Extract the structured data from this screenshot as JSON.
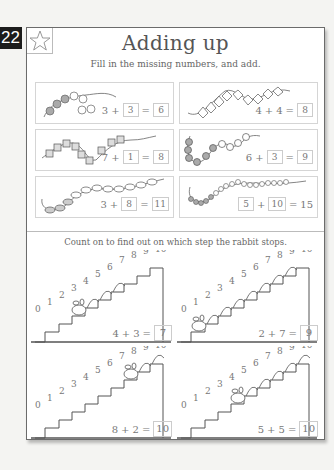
{
  "page_number": "22",
  "header": {
    "star_icon": "star-icon",
    "title": "Adding up",
    "subtitle": "Fill in the missing numbers, and add."
  },
  "bead_exercises": [
    {
      "a": "3",
      "b": "3",
      "sum": "6",
      "boxed": [
        "b",
        "sum"
      ],
      "bead_style": "round-grey-and-white"
    },
    {
      "a": "4",
      "b": "4",
      "sum": "8",
      "boxed": [
        "sum"
      ],
      "bead_style": "triangle-diamond"
    },
    {
      "a": "7",
      "b": "1",
      "sum": "8",
      "boxed": [
        "b",
        "sum"
      ],
      "bead_style": "cube"
    },
    {
      "a": "6",
      "b": "3",
      "sum": "9",
      "boxed": [
        "b",
        "sum"
      ],
      "bead_style": "round-grey-and-white"
    },
    {
      "a": "3",
      "b": "8",
      "sum": "11",
      "boxed": [
        "b",
        "sum"
      ],
      "bead_style": "oval"
    },
    {
      "a": "5",
      "b": "10",
      "sum": "15",
      "boxed": [
        "a",
        "b"
      ],
      "bead_style": "small-round"
    }
  ],
  "operators": {
    "plus": "+",
    "equals": "="
  },
  "stairs_section": {
    "instruction": "Count on to find out on which step the rabbit stops.",
    "step_labels": [
      "0",
      "1",
      "2",
      "3",
      "4",
      "5",
      "6",
      "7",
      "8",
      "9",
      "10"
    ],
    "exercises": [
      {
        "start": "4",
        "add": "3",
        "answer": "7"
      },
      {
        "start": "2",
        "add": "7",
        "answer": "9"
      },
      {
        "start": "8",
        "add": "2",
        "answer": "10"
      },
      {
        "start": "5",
        "add": "5",
        "answer": "10"
      }
    ]
  }
}
